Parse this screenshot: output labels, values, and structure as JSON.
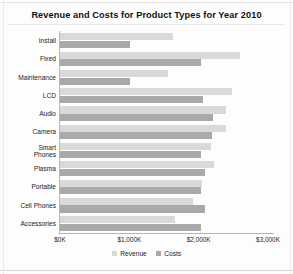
{
  "chart_data": {
    "type": "bar",
    "orientation": "horizontal",
    "title": "Revenue and Costs for Product Types for Year 2010",
    "xlabel": "",
    "ylabel": "",
    "xlim": [
      0,
      3000
    ],
    "xticks": [
      0,
      1000,
      2000,
      3000
    ],
    "xtick_labels": [
      "$0K",
      "$1,000K",
      "$2,000K",
      "$3,000K"
    ],
    "grid": false,
    "legend_position": "bottom",
    "units": "thousands of dollars (K)",
    "categories": [
      "Install",
      "Fixed",
      "Maintenance",
      "LCD",
      "Audio",
      "Camera",
      "Smart Phones",
      "Plasma",
      "Portable",
      "Cell Phones",
      "Accessories"
    ],
    "series": [
      {
        "name": "Revenue",
        "color": "#d9d9d9",
        "values": [
          1630,
          2600,
          1560,
          2480,
          2395,
          2395,
          2180,
          2220,
          2050,
          1920,
          1660
        ]
      },
      {
        "name": "Costs",
        "color": "#a9a9a9",
        "values": [
          1010,
          2030,
          1010,
          2060,
          2205,
          2190,
          2030,
          2090,
          2030,
          2090,
          2030
        ]
      }
    ]
  },
  "legend": {
    "items": [
      {
        "label": "Revenue",
        "swatch": "revenue"
      },
      {
        "label": "Costs",
        "swatch": "costs"
      }
    ]
  },
  "colors": {
    "revenue": "#d9d9d9",
    "costs": "#a9a9a9",
    "axis": "#b5b5b5",
    "text": "#1c1c1c",
    "background": "#fdfdfd"
  }
}
